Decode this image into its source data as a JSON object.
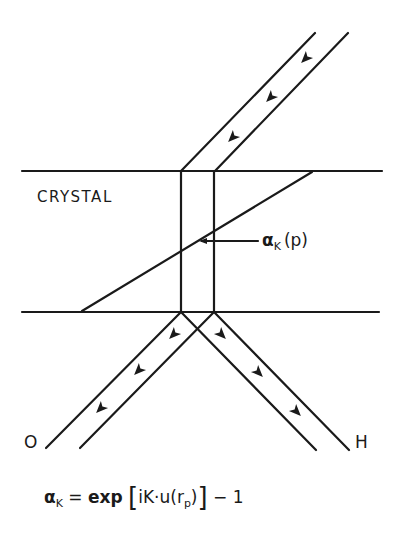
{
  "diagram": {
    "region_label": "CRYSTAL",
    "pointer_label": {
      "symbol": "α",
      "subscript": "K",
      "argument": "(p)"
    },
    "beam_labels": {
      "transmitted": "O",
      "diffracted": "H"
    },
    "formula": {
      "lhs_symbol": "α",
      "lhs_subscript": "K",
      "equals": "=",
      "func": "exp",
      "open_bracket": "[",
      "inner_pre": "iK·u(r",
      "inner_subscript": "p",
      "inner_post": ")",
      "close_bracket": "]",
      "tail": "− 1"
    },
    "stroke_color": "#1a1a1a",
    "background_color": "#ffffff"
  }
}
